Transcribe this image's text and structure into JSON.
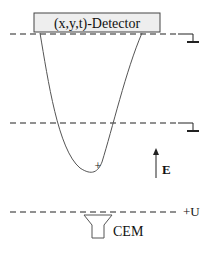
{
  "diagram": {
    "detector_label": "(x,y,t)-Detector",
    "field_label": "E",
    "voltage_label": "+U",
    "cem_label": "CEM",
    "marker": "+",
    "colors": {
      "line": "#222222",
      "detector_fill": "#eeeeee",
      "trajectory": "#555555"
    }
  }
}
